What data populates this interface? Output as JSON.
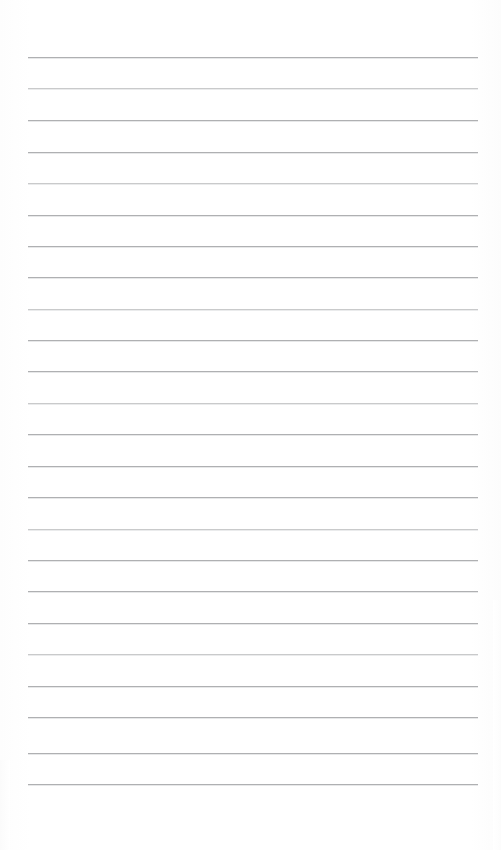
{
  "page": {
    "kind": "ruled-writing-page",
    "width": 501,
    "height": 850,
    "background_color": "#ffffff",
    "content_text": "",
    "is_blank": "true"
  },
  "ruling": {
    "line_color": "#a9aaac",
    "line_secondary_color": "#e6e7e8",
    "line_thickness_px": 1,
    "line_spacing_px": 31.5,
    "first_line_y": 57,
    "left_margin_x": 28,
    "right_margin_x": 478,
    "line_count": 24,
    "lines": [
      {
        "index": 1,
        "y": 57,
        "x1": 28,
        "x2": 478,
        "weight": "normal"
      },
      {
        "index": 2,
        "y": 88,
        "x1": 28,
        "x2": 478,
        "weight": "soft"
      },
      {
        "index": 3,
        "y": 120,
        "x1": 28,
        "x2": 478,
        "weight": "normal"
      },
      {
        "index": 4,
        "y": 152,
        "x1": 28,
        "x2": 478,
        "weight": "normal"
      },
      {
        "index": 5,
        "y": 183,
        "x1": 28,
        "x2": 478,
        "weight": "soft"
      },
      {
        "index": 6,
        "y": 215,
        "x1": 28,
        "x2": 478,
        "weight": "normal"
      },
      {
        "index": 7,
        "y": 246,
        "x1": 28,
        "x2": 478,
        "weight": "normal"
      },
      {
        "index": 8,
        "y": 277,
        "x1": 28,
        "x2": 478,
        "weight": "normal"
      },
      {
        "index": 9,
        "y": 309,
        "x1": 28,
        "x2": 478,
        "weight": "soft"
      },
      {
        "index": 10,
        "y": 340,
        "x1": 28,
        "x2": 478,
        "weight": "normal"
      },
      {
        "index": 11,
        "y": 371,
        "x1": 28,
        "x2": 478,
        "weight": "normal"
      },
      {
        "index": 12,
        "y": 403,
        "x1": 28,
        "x2": 478,
        "weight": "soft"
      },
      {
        "index": 13,
        "y": 434,
        "x1": 28,
        "x2": 478,
        "weight": "normal"
      },
      {
        "index": 14,
        "y": 466,
        "x1": 28,
        "x2": 478,
        "weight": "normal"
      },
      {
        "index": 15,
        "y": 497,
        "x1": 28,
        "x2": 478,
        "weight": "normal"
      },
      {
        "index": 16,
        "y": 529,
        "x1": 28,
        "x2": 478,
        "weight": "soft"
      },
      {
        "index": 17,
        "y": 560,
        "x1": 28,
        "x2": 478,
        "weight": "normal"
      },
      {
        "index": 18,
        "y": 591,
        "x1": 28,
        "x2": 478,
        "weight": "normal"
      },
      {
        "index": 19,
        "y": 623,
        "x1": 28,
        "x2": 478,
        "weight": "normal"
      },
      {
        "index": 20,
        "y": 654,
        "x1": 28,
        "x2": 478,
        "weight": "soft"
      },
      {
        "index": 21,
        "y": 686,
        "x1": 28,
        "x2": 478,
        "weight": "normal"
      },
      {
        "index": 22,
        "y": 717,
        "x1": 28,
        "x2": 478,
        "weight": "normal"
      },
      {
        "index": 23,
        "y": 753,
        "x1": 28,
        "x2": 478,
        "weight": "normal"
      },
      {
        "index": 24,
        "y": 784,
        "x1": 28,
        "x2": 478,
        "weight": "normal"
      }
    ]
  },
  "artifacts": {
    "watermark_text": "",
    "watermark_visible": "false",
    "note": ""
  }
}
